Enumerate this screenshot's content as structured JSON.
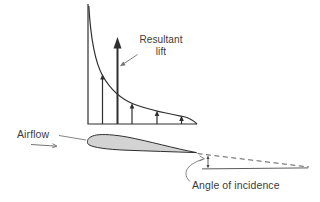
{
  "figure": {
    "labels": {
      "resultant_lift_line1": "Resultant",
      "resultant_lift_line2": "lift",
      "airflow": "Airflow",
      "angle_of_incidence": "Angle of incidence"
    },
    "colors": {
      "background": "#ffffff",
      "line": "#2f2f2f",
      "leader": "#757575",
      "reference_line": "#4a4a4a",
      "airfoil_fill": "#d3d3d3",
      "text": "#3b3b3b"
    },
    "lift_distribution": {
      "axis_x": 88,
      "axis_top_y": 4,
      "baseline_y": 124,
      "baseline_right_x": 197,
      "arrows": [
        {
          "x": 102.5,
          "tip_y": 74
        },
        {
          "x": 132,
          "tip_y": 103
        },
        {
          "x": 157,
          "tip_y": 110.5
        },
        {
          "x": 181.5,
          "tip_y": 115.5
        }
      ],
      "resultant_arrow": {
        "x": 117.5,
        "tip_y": 37
      }
    }
  }
}
